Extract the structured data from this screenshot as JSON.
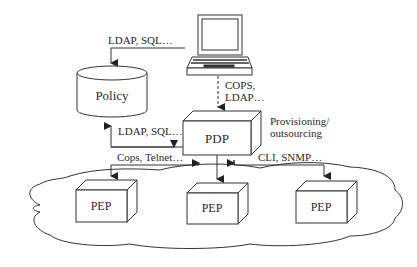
{
  "diagram": {
    "nodes": {
      "policy": {
        "label": "Policy",
        "shape": "cylinder"
      },
      "pdp": {
        "label": "PDP",
        "shape": "3d-box"
      },
      "laptop": {
        "label": "",
        "shape": "laptop-icon"
      },
      "pep_left": {
        "label": "PEP",
        "shape": "3d-box"
      },
      "pep_center": {
        "label": "PEP",
        "shape": "3d-box"
      },
      "pep_right": {
        "label": "PEP",
        "shape": "3d-box"
      },
      "network": {
        "label": "",
        "shape": "cloud"
      }
    },
    "edges": {
      "laptop_to_policy": {
        "label": "LDAP, SQL…"
      },
      "laptop_to_pdp_line1": "COPS,",
      "laptop_to_pdp_line2": "LDAP…",
      "pdp_to_policy": {
        "label": "LDAP, SQL…"
      },
      "pep_left_pdp": {
        "label": "Cops, Telnet…"
      },
      "pep_right_pdp": {
        "label": "CLI, SNMP…"
      }
    },
    "annotations": {
      "pdp_note_line1": "Provisioning/",
      "pdp_note_line2": "outsourcing"
    },
    "colors": {
      "stroke": "#333333",
      "text": "#2a2a2a",
      "background": "#ffffff"
    }
  }
}
